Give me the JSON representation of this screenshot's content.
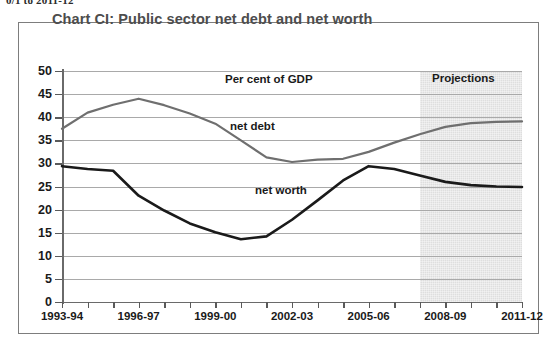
{
  "page_header": "0/1 to 2011-12",
  "chart_frame": {
    "title": "Chart CI: Public sector net debt and net worth"
  },
  "annotations": {
    "units": "Per cent of GDP",
    "projections": "Projections",
    "net_debt_label": "net debt",
    "net_worth_label": "net worth"
  },
  "colors": {
    "net_debt": "#6f6f6f",
    "net_worth": "#1a1a1a",
    "projection_band": "#dedede",
    "gridline": "#a9a9a9",
    "frame": "#7d7d7d",
    "title": "#4d4d4d"
  },
  "chart_data": {
    "type": "line",
    "title": "Chart CI: Public sector net debt and net worth",
    "subtitle": "Per cent of GDP",
    "xlabel": "",
    "ylabel": "Per cent of GDP",
    "ylim": [
      0,
      50
    ],
    "yticks": [
      0,
      5,
      10,
      15,
      20,
      25,
      30,
      35,
      40,
      45,
      50
    ],
    "ytick_labels": [
      "0",
      "5",
      "10",
      "15",
      "20",
      "25",
      "30",
      "35",
      "40",
      "45",
      "50"
    ],
    "grid": true,
    "legend": "inline-labels",
    "x": [
      "1993-94",
      "1994-95",
      "1995-96",
      "1996-97",
      "1997-98",
      "1998-99",
      "1999-00",
      "2000-01",
      "2001-02",
      "2002-03",
      "2003-04",
      "2004-05",
      "2005-06",
      "2006-07",
      "2007-08",
      "2008-09",
      "2009-10",
      "2010-11",
      "2011-12"
    ],
    "xtick_labels": [
      "1993-94",
      "1996-97",
      "1999-00",
      "2002-03",
      "2005-06",
      "2008-09",
      "2011-12"
    ],
    "xtick_label_every": 3,
    "projection_start": "2007-08",
    "projection_band_label": "Projections",
    "series": [
      {
        "name": "net debt",
        "color": "#6f6f6f",
        "values": [
          37.5,
          41.0,
          42.7,
          44.0,
          42.6,
          40.8,
          38.6,
          35.0,
          31.3,
          30.3,
          30.8,
          31.0,
          32.5,
          34.5,
          36.3,
          37.9,
          38.7,
          39.0,
          39.1
        ]
      },
      {
        "name": "net worth",
        "color": "#1a1a1a",
        "values": [
          29.4,
          28.8,
          28.4,
          23.0,
          19.8,
          17.0,
          15.1,
          13.6,
          14.2,
          17.8,
          22.0,
          26.3,
          29.4,
          28.8,
          27.4,
          26.0,
          25.3,
          25.0,
          24.9
        ]
      }
    ]
  }
}
